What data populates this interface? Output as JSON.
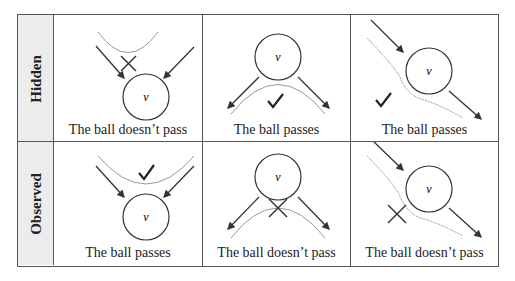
{
  "rows": [
    {
      "label": "Hidden"
    },
    {
      "label": "Observed"
    }
  ],
  "cells": [
    {
      "row": 0,
      "col": 0,
      "caption": "The ball doesn’t pass",
      "result": "x-mark-icon",
      "node_label": "v"
    },
    {
      "row": 0,
      "col": 1,
      "caption": "The ball passes",
      "result": "check-mark-icon",
      "node_label": "v"
    },
    {
      "row": 0,
      "col": 2,
      "caption": "The ball passes",
      "result": "check-mark-icon",
      "node_label": "v"
    },
    {
      "row": 1,
      "col": 0,
      "caption": "The ball passes",
      "result": "check-mark-icon",
      "node_label": "v"
    },
    {
      "row": 1,
      "col": 1,
      "caption": "The ball doesn’t pass",
      "result": "x-mark-icon",
      "node_label": "v"
    },
    {
      "row": 1,
      "col": 2,
      "caption": "The ball doesn’t pass",
      "result": "x-mark-icon",
      "node_label": "v"
    }
  ],
  "colors": {
    "arrow": "#333333",
    "ball_path": "#999999",
    "label_bg": "#ececec",
    "border": "#555555"
  }
}
